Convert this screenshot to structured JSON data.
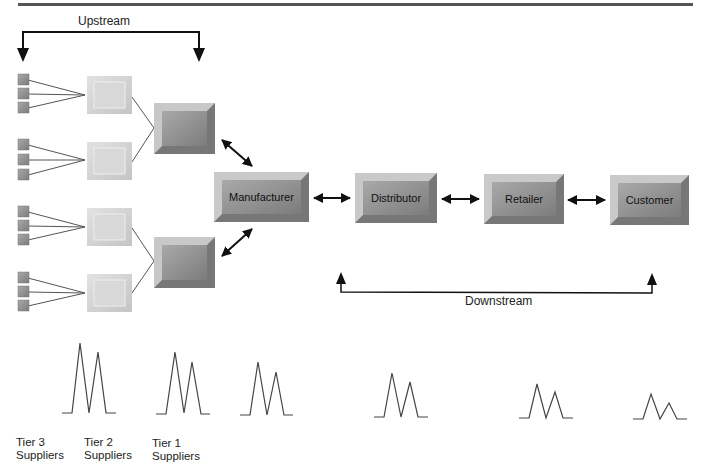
{
  "labels": {
    "upstream": "Upstream",
    "downstream": "Downstream"
  },
  "nodes": {
    "manufacturer": "Manufacturer",
    "distributor": "Distributor",
    "retailer": "Retailer",
    "customer": "Customer"
  },
  "tiers": [
    {
      "line1": "Tier 3",
      "line2": "Suppliers"
    },
    {
      "line1": "Tier 2",
      "line2": "Suppliers"
    },
    {
      "line1": "Tier 1",
      "line2": "Suppliers"
    }
  ],
  "colors": {
    "rule": "#555555",
    "box_dark": "#8a8a8a",
    "box_light": "#cfcfcf",
    "arrow": "#111111"
  },
  "demand_waveforms": [
    {
      "stage": "Tier 2",
      "peak1": 56,
      "peak2": 45
    },
    {
      "stage": "Tier 1",
      "peak1": 46,
      "peak2": 36
    },
    {
      "stage": "Manufacturer",
      "peak1": 38,
      "peak2": 28
    },
    {
      "stage": "Distributor",
      "peak1": 32,
      "peak2": 23
    },
    {
      "stage": "Retailer",
      "peak1": 23,
      "peak2": 17
    },
    {
      "stage": "Customer",
      "peak1": 16,
      "peak2": 10
    }
  ]
}
